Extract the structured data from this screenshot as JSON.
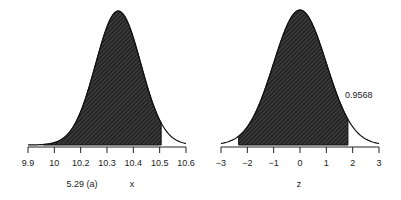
{
  "chart_data": [
    {
      "type": "area",
      "title": "",
      "caption": "5.29 (a)",
      "xlabel": "x",
      "ylabel": "",
      "distribution": {
        "family": "normal",
        "mean": 10.3,
        "sd": 0.1
      },
      "xlim": [
        9.9,
        10.6
      ],
      "tick_labels": [
        "9.9",
        "10",
        "10.2",
        "10.3",
        "10.4",
        "10.5",
        "10.6"
      ],
      "shaded_region": {
        "from": 9.967,
        "to": 10.49
      },
      "grid": false,
      "legend": null
    },
    {
      "type": "area",
      "title": "",
      "xlabel": "z",
      "ylabel": "",
      "distribution": {
        "family": "normal",
        "mean": 0,
        "sd": 1
      },
      "xlim": [
        -3,
        3
      ],
      "tick_labels": [
        "−3",
        "−2",
        "−1",
        "0",
        "1",
        "2",
        "3"
      ],
      "shaded_region": {
        "from": -2.33,
        "to": 1.82
      },
      "annotation": "0.9568",
      "grid": false,
      "legend": null
    }
  ],
  "left": {
    "caption": "5.29 (a)",
    "xlabel": "x",
    "ticks": [
      "9.9",
      "10",
      "10.2",
      "10.3",
      "10.4",
      "10.5",
      "10.6"
    ]
  },
  "right": {
    "xlabel": "z",
    "annotation": "0.9568",
    "ticks": [
      "−3",
      "−2",
      "−1",
      "0",
      "1",
      "2",
      "3"
    ]
  }
}
